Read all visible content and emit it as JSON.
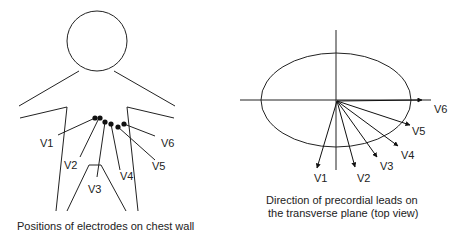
{
  "left_diagram": {
    "caption": "Positions of electrodes on chest wall",
    "electrodes": [
      "V1",
      "V2",
      "V3",
      "V4",
      "V5",
      "V6"
    ]
  },
  "right_diagram": {
    "caption_line1": "Direction of precordial leads on",
    "caption_line2": "the transverse plane (top view)",
    "leads": [
      "V1",
      "V2",
      "V3",
      "V4",
      "V5",
      "V6"
    ]
  },
  "colors": {
    "stroke": "#222222",
    "background": "#ffffff"
  }
}
